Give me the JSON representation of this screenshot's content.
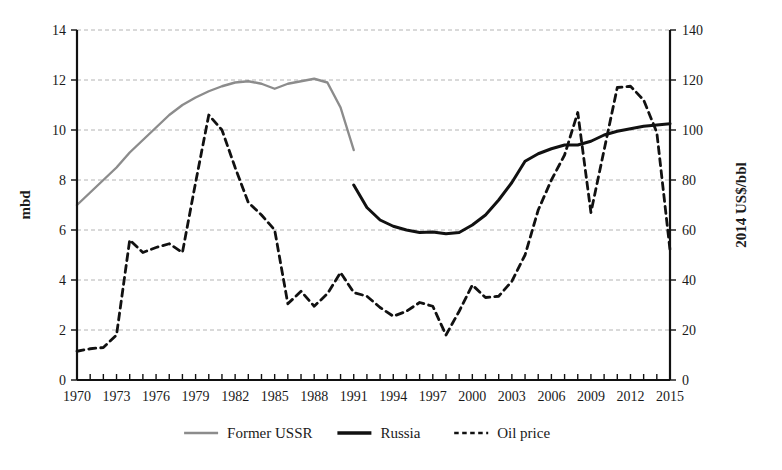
{
  "chart_data": {
    "type": "line",
    "title": "",
    "xlabel": "",
    "ylabel": "mbd",
    "y2label": "2014 US$/bbl",
    "xlim": [
      1970,
      2015
    ],
    "ylim": [
      0,
      14
    ],
    "y2lim": [
      0,
      140
    ],
    "grid": true,
    "legend_position": "bottom",
    "x_ticks": [
      1970,
      1971,
      1972,
      1973,
      1974,
      1975,
      1976,
      1977,
      1978,
      1979,
      1980,
      1981,
      1982,
      1983,
      1984,
      1985,
      1986,
      1987,
      1988,
      1989,
      1990,
      1991,
      1992,
      1993,
      1994,
      1995,
      1996,
      1997,
      1998,
      1999,
      2000,
      2001,
      2002,
      2003,
      2004,
      2005,
      2006,
      2007,
      2008,
      2009,
      2010,
      2011,
      2012,
      2013,
      2014,
      2015
    ],
    "x_tick_labels": [
      "1970",
      "1973",
      "1976",
      "1979",
      "1982",
      "1985",
      "1988",
      "1991",
      "1994",
      "1997",
      "2000",
      "2003",
      "2006",
      "2009",
      "2012",
      "2015"
    ],
    "x_tick_label_values": [
      1970,
      1973,
      1976,
      1979,
      1982,
      1985,
      1988,
      1991,
      1994,
      1997,
      2000,
      2003,
      2006,
      2009,
      2012,
      2015
    ],
    "y_tick_labels": [
      "0",
      "2",
      "4",
      "6",
      "8",
      "10",
      "12",
      "14"
    ],
    "y_tick_values": [
      0,
      2,
      4,
      6,
      8,
      10,
      12,
      14
    ],
    "y2_tick_labels": [
      "0",
      "20",
      "40",
      "60",
      "80",
      "100",
      "120",
      "140"
    ],
    "y2_tick_values": [
      0,
      20,
      40,
      60,
      80,
      100,
      120,
      140
    ],
    "series": [
      {
        "name": "Former USSR",
        "axis": "left",
        "color": "#8c8c8c",
        "width": 2.4,
        "dash": "none",
        "x": [
          1970,
          1971,
          1972,
          1973,
          1974,
          1975,
          1976,
          1977,
          1978,
          1979,
          1980,
          1981,
          1982,
          1983,
          1984,
          1985,
          1986,
          1987,
          1988,
          1989,
          1990,
          1991
        ],
        "values": [
          7.0,
          7.5,
          8.0,
          8.5,
          9.1,
          9.6,
          10.1,
          10.6,
          11.0,
          11.3,
          11.55,
          11.75,
          11.9,
          11.95,
          11.85,
          11.65,
          11.85,
          11.95,
          12.05,
          11.9,
          10.9,
          9.2
        ]
      },
      {
        "name": "Russia",
        "axis": "left",
        "color": "#111111",
        "width": 3.0,
        "dash": "none",
        "x": [
          1991,
          1992,
          1993,
          1994,
          1995,
          1996,
          1997,
          1998,
          1999,
          2000,
          2001,
          2002,
          2003,
          2004,
          2005,
          2006,
          2007,
          2008,
          2009,
          2010,
          2011,
          2012,
          2013,
          2014,
          2015
        ],
        "values": [
          7.8,
          6.9,
          6.4,
          6.15,
          6.0,
          5.9,
          5.92,
          5.85,
          5.9,
          6.2,
          6.6,
          7.2,
          7.9,
          8.75,
          9.05,
          9.25,
          9.4,
          9.4,
          9.55,
          9.8,
          9.95,
          10.05,
          10.15,
          10.2,
          10.25
        ]
      },
      {
        "name": "Oil price",
        "axis": "right",
        "color": "#111111",
        "width": 2.8,
        "dash": "7 5",
        "x": [
          1970,
          1971,
          1972,
          1973,
          1974,
          1975,
          1976,
          1977,
          1978,
          1979,
          1980,
          1981,
          1982,
          1983,
          1984,
          1985,
          1986,
          1987,
          1988,
          1989,
          1990,
          1991,
          1992,
          1993,
          1994,
          1995,
          1996,
          1997,
          1998,
          1999,
          2000,
          2001,
          2002,
          2003,
          2004,
          2005,
          2006,
          2007,
          2008,
          2009,
          2010,
          2011,
          2012,
          2013,
          2014,
          2015
        ],
        "values": [
          11.5,
          12.5,
          13.0,
          18.0,
          56.0,
          51.0,
          53.0,
          54.5,
          51.0,
          79.0,
          106.0,
          100.0,
          85.0,
          71.0,
          66.0,
          60.0,
          30.5,
          35.5,
          29.5,
          34.5,
          43.0,
          35.0,
          33.5,
          29.0,
          25.5,
          27.5,
          31.0,
          29.5,
          18.0,
          27.5,
          38.0,
          33.0,
          33.5,
          39.5,
          50.0,
          68.0,
          80.0,
          90.0,
          107.0,
          67.0,
          92.0,
          117.0,
          117.5,
          112.0,
          99.0,
          52.0
        ]
      }
    ]
  },
  "legend": {
    "entries": [
      {
        "label": "Former USSR",
        "color": "#8c8c8c",
        "dash": "none",
        "width": 2.4
      },
      {
        "label": "Russia",
        "color": "#111111",
        "dash": "none",
        "width": 3.4
      },
      {
        "label": "Oil price",
        "color": "#111111",
        "dash": "4.5 3.5",
        "width": 2.6
      }
    ]
  },
  "axes": {
    "left_title": "mbd",
    "right_title": "2014 US$/bbl"
  }
}
